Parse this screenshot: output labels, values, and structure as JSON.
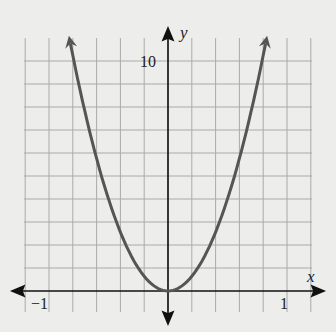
{
  "chart_data": {
    "type": "line",
    "title": "",
    "xlabel": "x",
    "ylabel": "y",
    "xlim": [
      -1.2,
      1.2
    ],
    "ylim": [
      -1,
      11
    ],
    "x_ticks_labeled": [
      {
        "value": -1,
        "label": "−1"
      },
      {
        "value": 1,
        "label": "1"
      }
    ],
    "y_ticks_labeled": [
      {
        "value": 10,
        "label": "10"
      }
    ],
    "grid": true,
    "grid_x_step": 0.2,
    "grid_y_step": 1,
    "series": [
      {
        "name": "y = 16x^2",
        "x": [
          -0.8,
          -0.6,
          -0.4,
          -0.2,
          0,
          0.2,
          0.4,
          0.6,
          0.8
        ],
        "values": [
          10.24,
          5.76,
          2.56,
          0.64,
          0,
          0.64,
          2.56,
          5.76,
          10.24
        ],
        "color": "#555555"
      }
    ]
  },
  "labels": {
    "x_axis": "x",
    "y_axis": "y",
    "x_min": "−1",
    "x_max": "1",
    "y_max": "10"
  }
}
